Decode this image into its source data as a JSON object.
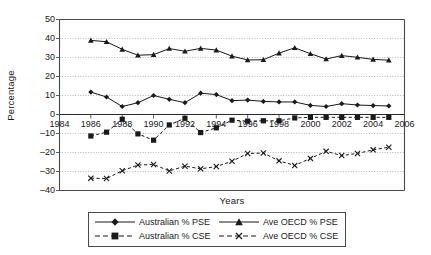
{
  "chart_data": {
    "type": "line",
    "title": "",
    "xlabel": "Years",
    "ylabel": "Percentage",
    "xlim": [
      1984,
      2006
    ],
    "ylim": [
      -40,
      50
    ],
    "xticks": [
      1984,
      1986,
      1988,
      1990,
      1992,
      1994,
      1996,
      1998,
      2000,
      2002,
      2004,
      2006
    ],
    "yticks": [
      50,
      40,
      30,
      20,
      10,
      0,
      -10,
      -20,
      -30,
      -40
    ],
    "ytick_labels": [
      "50",
      "40",
      "30",
      "20",
      "10",
      "0",
      "–10",
      "–20",
      "–30",
      "–40"
    ],
    "xtick_labels": [
      "1984",
      "1986",
      "1988",
      "1990",
      "1992",
      "1994",
      "1996",
      "1998",
      "2000",
      "2002",
      "2004",
      "2006"
    ],
    "grid": true,
    "grid_axis": "y",
    "legend_position": "bottom",
    "x": [
      1986,
      1987,
      1988,
      1989,
      1990,
      1991,
      1992,
      1993,
      1994,
      1995,
      1996,
      1997,
      1998,
      1999,
      2000,
      2001,
      2002,
      2003,
      2004,
      2005
    ],
    "series": [
      {
        "name": "Australian % PSE",
        "marker": "diamond",
        "dash": "solid",
        "color": "#1a1a1a",
        "values": [
          11.8,
          9.2,
          4.2,
          6.2,
          10.0,
          8.0,
          6.2,
          11.2,
          10.5,
          7.3,
          7.6,
          6.9,
          6.6,
          6.6,
          4.8,
          4.2,
          5.7,
          5.0,
          4.7,
          4.5
        ]
      },
      {
        "name": "Ave OECD % PSE",
        "marker": "triangle",
        "dash": "solid",
        "color": "#1a1a1a",
        "values": [
          39.0,
          38.3,
          34.3,
          31.2,
          31.5,
          34.7,
          33.3,
          34.8,
          33.9,
          30.7,
          28.7,
          28.8,
          32.3,
          35.1,
          32.0,
          29.2,
          31.0,
          30.1,
          29.0,
          28.6
        ]
      },
      {
        "name": "Australian % CSE",
        "marker": "square",
        "dash": "dashed",
        "color": "#1a1a1a",
        "values": [
          -11.3,
          -9.3,
          -2.5,
          -10.2,
          -13.5,
          -5.5,
          -2.0,
          -9.5,
          -7.0,
          -3.0,
          -3.5,
          -3.3,
          -3.3,
          -1.8,
          -1.5,
          -1.5,
          -1.5,
          -1.5,
          -1.5,
          -1.5
        ]
      },
      {
        "name": "Ave OECD % CSE",
        "marker": "x",
        "dash": "dashed",
        "color": "#1a1a1a",
        "values": [
          -33.5,
          -33.7,
          -29.6,
          -26.6,
          -26.3,
          -29.7,
          -27.2,
          -28.6,
          -27.4,
          -24.6,
          -20.5,
          -20.3,
          -24.4,
          -26.8,
          -23.1,
          -19.4,
          -21.6,
          -20.5,
          -18.6,
          -17.2
        ]
      }
    ]
  },
  "legend": {
    "items": [
      {
        "label": "Australian % PSE"
      },
      {
        "label": "Ave OECD % PSE"
      },
      {
        "label": "Australian % CSE"
      },
      {
        "label": "Ave OECD % CSE"
      }
    ]
  }
}
